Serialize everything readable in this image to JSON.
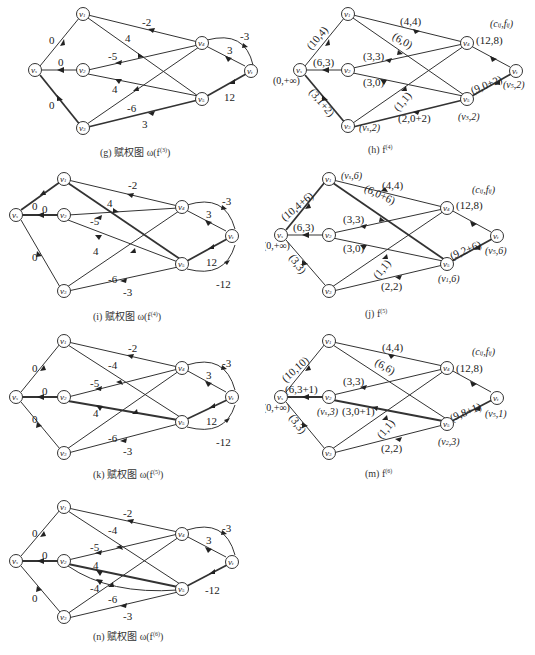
{
  "nodes": {
    "s": {
      "label": "v",
      "sub": "s"
    },
    "v1": {
      "label": "v",
      "sub": "1"
    },
    "v2": {
      "label": "v",
      "sub": "2"
    },
    "v3": {
      "label": "v",
      "sub": "3"
    },
    "v4": {
      "label": "v",
      "sub": "4"
    },
    "v5": {
      "label": "v",
      "sub": "5"
    },
    "t": {
      "label": "v",
      "sub": "t"
    }
  },
  "legend_cf": "(c",
  "panels": {
    "g": {
      "caption": "(g) 赋权图 ω(f",
      "caption_sup": "(3)",
      "caption_end": ")",
      "edges": {
        "s_v1": "0",
        "s_v2": "0",
        "s_v3": "0",
        "v4_v1": "-2",
        "v1_v5": "4",
        "v4_v2": "-5",
        "v2_v5": "4",
        "v4_v3": "-6",
        "v3_v5": "3",
        "v4_t": "3",
        "t_v4": "-3",
        "v5_t": "12"
      }
    },
    "h": {
      "caption": "(h) f",
      "caption_sup": "(4)",
      "legend": "(c",
      "edges": {
        "s_v1": "(10,4)",
        "s_v2": "(6,3)",
        "s_v3": "(3,1+2)",
        "v1_v4": "(4,4)",
        "v1_v5": "(6,0)",
        "v2_v4": "(3,3)",
        "v2_v5": "(3,0)",
        "v3_v4": "(1,1)",
        "v3_v5": "(2,0+2)",
        "v4_t": "(12,8)",
        "v5_t": "(9,0+2)"
      },
      "labels": {
        "s": "(0,+∞)",
        "v3": "(v",
        "v3_sub": "s",
        "v3_end": ",2)",
        "v5": "(v",
        "v5_sub": "3",
        "v5_end": ",2)",
        "t": "(v",
        "t_sub": "5",
        "t_end": ",2)"
      }
    },
    "i": {
      "caption": "(i) 赋权图 ω(f",
      "caption_sup": "(4)",
      "caption_end": ")",
      "edges": {
        "s_v1": "0",
        "s_v2": "0",
        "s_v3": "0",
        "v4_v1": "-2",
        "v1_v5": "4",
        "v4_v2": "-5",
        "v2_v5": "4",
        "v4_v3": "-6",
        "v5_v3": "-3",
        "v4_t": "3",
        "t_v4": "-3",
        "v5_t": "12",
        "t_v5": "-12"
      }
    },
    "j": {
      "caption": "(j) f",
      "caption_sup": "(5)",
      "edges": {
        "s_v1": "(10,4+6)",
        "s_v2": "(6,3)",
        "s_v3": "(3,3)",
        "v1_v4": "(4,4)",
        "v1_v5": "(6,0+6)",
        "v2_v4": "(3,3)",
        "v2_v5": "(3,0)",
        "v3_v4": "(1,1)",
        "v3_v5": "(2,2)",
        "v4_t": "(12,8)",
        "v5_t": "(9,2+6)"
      },
      "labels": {
        "s": "(0,+∞)",
        "v1": "(v",
        "v1_sub": "s",
        "v1_end": ",6)",
        "v5": "(v",
        "v5_sub": "1",
        "v5_end": ",6)",
        "t": "(v",
        "t_sub": "5",
        "t_end": ",6)"
      }
    },
    "k": {
      "caption": "(k) 赋权图 ω(f",
      "caption_sup": "(5)",
      "caption_end": ")",
      "edges": {
        "s_v1": "0",
        "s_v2": "0",
        "s_v3": "0",
        "v4_v1": "-2",
        "v5_v1": "-4",
        "v4_v2": "-5",
        "v2_v5": "4",
        "v4_v3": "-6",
        "v5_v3": "-3",
        "v4_t": "3",
        "t_v4": "-3",
        "v5_t": "12",
        "t_v5": "-12"
      }
    },
    "m": {
      "caption": "(m) f",
      "caption_sup": "(6)",
      "edges": {
        "s_v1": "(10,10)",
        "s_v2": "(6,3+1)",
        "s_v3": "(3,3)",
        "v1_v4": "(4,4)",
        "v1_v5": "(6,6)",
        "v2_v4": "(3,3)",
        "v2_v5": "(3,0+1)",
        "v3_v4": "(1,1)",
        "v3_v5": "(2,2)",
        "v4_t": "(12,8)",
        "v5_t": "(9,8+1)"
      },
      "labels": {
        "s": "(0,+∞)",
        "v2": "(v",
        "v2_sub": "s",
        "v2_end": ",3)",
        "v5": "(v",
        "v5_sub": "2",
        "v5_end": ",3)",
        "t": "(v",
        "t_sub": "5",
        "t_end": ",1)"
      }
    },
    "n": {
      "caption": "(n) 赋权图 ω(f",
      "caption_sup": "(6)",
      "caption_end": ")",
      "edges": {
        "s_v1": "0",
        "s_v2": "0",
        "s_v3": "0",
        "v4_v1": "-2",
        "v5_v1": "-4",
        "v4_v2": "-5",
        "v2_v5": "4",
        "v5_v2": "-4",
        "v4_v3": "-6",
        "v5_v3": "-3",
        "v4_t": "3",
        "t_v4": "-3",
        "t_v5": "-12"
      }
    }
  }
}
